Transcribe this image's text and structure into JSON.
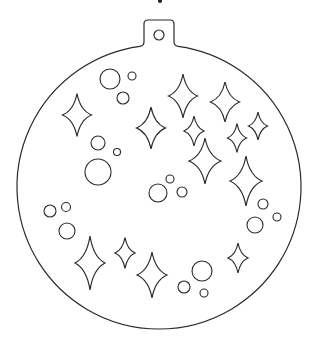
{
  "canvas": {
    "width": 315,
    "height": 350,
    "background": "#ffffff",
    "stroke": "#2a2a2a"
  },
  "ornament": {
    "label": "Christmas ornament bauble outline",
    "body": {
      "cx": 159,
      "cy": 187,
      "r": 142
    },
    "hanger": {
      "left": 144,
      "right": 174,
      "top": 20,
      "join_y": 43,
      "corner_r": 4
    },
    "hanger_hole": {
      "cx": 159,
      "cy": 35,
      "r": 5
    }
  },
  "sparkles": [
    {
      "cx": 77,
      "cy": 115,
      "w": 29,
      "h": 43
    },
    {
      "cx": 151,
      "cy": 128,
      "w": 29,
      "h": 42
    },
    {
      "cx": 183,
      "cy": 96,
      "w": 29,
      "h": 44
    },
    {
      "cx": 225,
      "cy": 102,
      "w": 29,
      "h": 40
    },
    {
      "cx": 194,
      "cy": 131,
      "w": 20,
      "h": 30
    },
    {
      "cx": 258,
      "cy": 126,
      "w": 19,
      "h": 28
    },
    {
      "cx": 237,
      "cy": 138,
      "w": 19,
      "h": 29
    },
    {
      "cx": 205,
      "cy": 161,
      "w": 32,
      "h": 46
    },
    {
      "cx": 246,
      "cy": 181,
      "w": 32,
      "h": 50
    },
    {
      "cx": 90,
      "cy": 263,
      "w": 30,
      "h": 54
    },
    {
      "cx": 125,
      "cy": 253,
      "w": 20,
      "h": 31
    },
    {
      "cx": 152,
      "cy": 275,
      "w": 30,
      "h": 46
    },
    {
      "cx": 238,
      "cy": 258,
      "w": 20,
      "h": 30
    }
  ],
  "bubbles": [
    {
      "cx": 110,
      "cy": 79,
      "r": 10
    },
    {
      "cx": 132,
      "cy": 76,
      "r": 4
    },
    {
      "cx": 123,
      "cy": 98,
      "r": 6
    },
    {
      "cx": 98,
      "cy": 143,
      "r": 7
    },
    {
      "cx": 117,
      "cy": 152,
      "r": 3.5
    },
    {
      "cx": 98,
      "cy": 172,
      "r": 13
    },
    {
      "cx": 170,
      "cy": 179,
      "r": 4
    },
    {
      "cx": 158,
      "cy": 193,
      "r": 9
    },
    {
      "cx": 182,
      "cy": 192,
      "r": 5
    },
    {
      "cx": 50,
      "cy": 211,
      "r": 6
    },
    {
      "cx": 66,
      "cy": 207,
      "r": 4.5
    },
    {
      "cx": 67,
      "cy": 231,
      "r": 8
    },
    {
      "cx": 263,
      "cy": 204,
      "r": 5
    },
    {
      "cx": 277,
      "cy": 217,
      "r": 4
    },
    {
      "cx": 255,
      "cy": 225,
      "r": 8
    },
    {
      "cx": 202,
      "cy": 271,
      "r": 10
    },
    {
      "cx": 184,
      "cy": 287,
      "r": 6
    },
    {
      "cx": 204,
      "cy": 293,
      "r": 4
    }
  ]
}
